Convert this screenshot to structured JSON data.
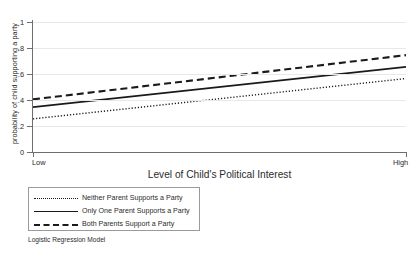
{
  "chart_data": {
    "type": "line",
    "title": "",
    "xlabel": "Level of Child's Political Interest",
    "ylabel": "probability of child supporting a party",
    "caption": "Logistic Regression Model",
    "xlim": [
      0,
      1
    ],
    "ylim": [
      0,
      1
    ],
    "grid": true,
    "legend_position": "below-left",
    "x_tick_labels": [
      "Low",
      "High"
    ],
    "x_tick_values": [
      0,
      1
    ],
    "y_tick_labels": [
      "0",
      ".2",
      ".4",
      ".6",
      ".8",
      "1"
    ],
    "y_tick_values": [
      0,
      0.2,
      0.4,
      0.6,
      0.8,
      1
    ],
    "x": [
      0,
      1
    ],
    "series": [
      {
        "name": "Neither Parent Supports a Party",
        "style": "dotted",
        "color": "#1a1a1a",
        "values": [
          0.255,
          0.565
        ]
      },
      {
        "name": "Only One Parent Supports a Party",
        "style": "solid",
        "color": "#1a1a1a",
        "values": [
          0.345,
          0.655
        ]
      },
      {
        "name": "Both Parents Support a Party",
        "style": "dashed",
        "color": "#1a1a1a",
        "values": [
          0.405,
          0.745
        ]
      }
    ]
  },
  "legend": {
    "items": [
      {
        "label": "Neither Parent Supports a Party"
      },
      {
        "label": "Only One Parent Supports a Party"
      },
      {
        "label": "Both Parents Support a Party"
      }
    ]
  }
}
